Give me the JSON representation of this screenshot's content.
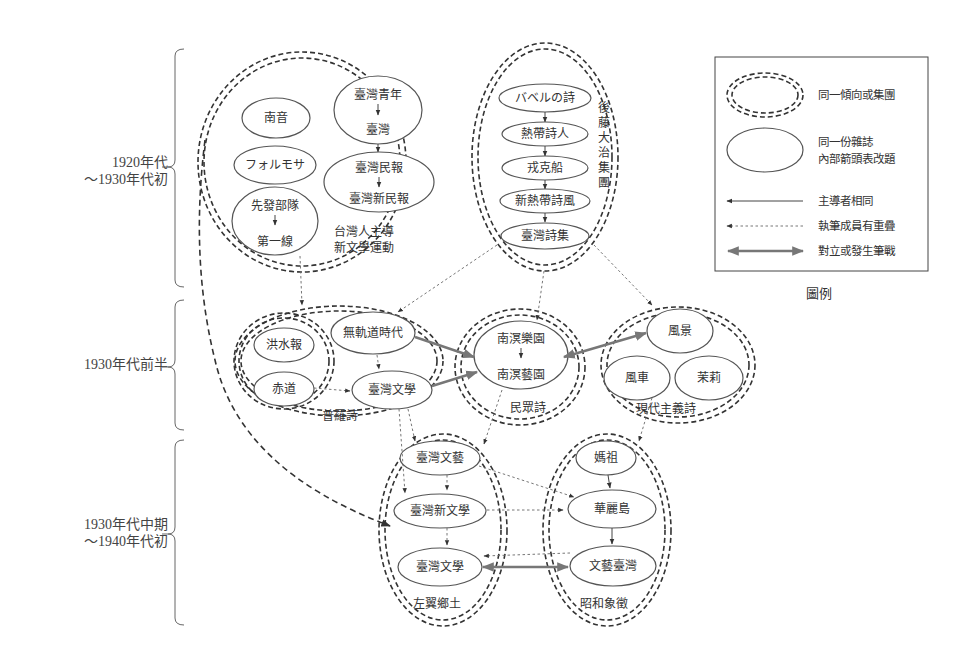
{
  "periods": [
    {
      "line1": "1920年代",
      "line2": "～1930年代初"
    },
    {
      "line1": "1930年代前半",
      "line2": ""
    },
    {
      "line1": "1930年代中期",
      "line2": "～1940年代初"
    }
  ],
  "groups": {
    "taiwanese_new_lit": {
      "line1": "台灣人主導",
      "line2": "新文學運動"
    },
    "goto_group": {
      "label": [
        "後",
        "藤",
        "大",
        "治",
        "集",
        "團"
      ]
    },
    "proletarian": {
      "label": "普羅詩"
    },
    "folk_poetry": {
      "label": "民眾詩"
    },
    "modernist": {
      "label": "現代主義詩"
    },
    "left_nativist": {
      "label": "左翼鄉土"
    },
    "showa_symbolism": {
      "label": "昭和象徵"
    }
  },
  "nodes": {
    "nanyin": "南音",
    "formosa": "フォルモサ",
    "xianfa": "先發部隊",
    "diyixian": "第一線",
    "taiwan_qingnian": "臺灣青年",
    "taiwan": "臺灣",
    "taiwan_minbao": "臺灣民報",
    "taiwan_xinminbao": "臺灣新民報",
    "babel": "バベルの詩",
    "redai_shiren": "熱帶詩人",
    "rongkechuan": "戎克船",
    "xinredai_shifeng": "新熱帶詩風",
    "taiwan_shiji": "臺灣詩集",
    "hongshuibao": "洪水報",
    "chidao": "赤道",
    "wuguidao": "無軌道時代",
    "taiwan_wenxue_1": "臺灣文學",
    "nanming_yuyuan": "南溟樂園",
    "nanming_yiyuan": "南溟藝園",
    "fengjing": "風景",
    "fengche": "風車",
    "moli": "茉莉",
    "taiwan_wenyi": "臺灣文藝",
    "taiwan_xinwenxue": "臺灣新文學",
    "taiwan_wenxue_2": "臺灣文學",
    "mazu": "媽祖",
    "hualidao": "華麗島",
    "wenyi_taiwan": "文藝臺灣"
  },
  "legend": {
    "title": "圖例",
    "items": [
      {
        "symbol": "double-dashed-ellipse",
        "line1": "同一傾向或集團",
        "line2": ""
      },
      {
        "symbol": "solid-ellipse",
        "line1": "同一份雜誌",
        "line2": "內部箭頭表改題"
      },
      {
        "symbol": "solid-arrow",
        "line1": "主導者相同",
        "line2": ""
      },
      {
        "symbol": "dotted-arrow",
        "line1": "執筆成員有重疊",
        "line2": ""
      },
      {
        "symbol": "thick-double-arrow",
        "line1": "對立或發生筆戰",
        "line2": ""
      }
    ]
  },
  "colors": {
    "stroke": "#333333",
    "node_stroke": "#555555",
    "conflict": "#777777",
    "background": "#ffffff"
  }
}
